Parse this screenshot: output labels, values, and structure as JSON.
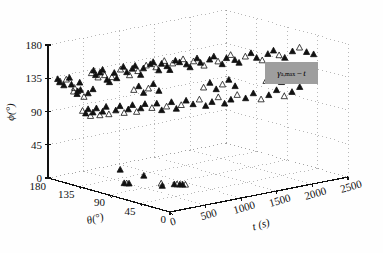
{
  "figure": {
    "kind": "3d-scatter-plot",
    "background": "#ffffff",
    "marker_fill_color": "#111111",
    "marker_edge_color": "#111111",
    "grid_color": "#9a9a9a",
    "axis_color": "#111111",
    "legend_box_color": "#9e9e9e"
  },
  "axes": {
    "phi": {
      "label": "ϕ(°)",
      "ticks": [
        "180",
        "135",
        "90",
        "45",
        "0"
      ],
      "values": [
        180,
        135,
        90,
        45,
        0
      ],
      "min": 0,
      "max": 180
    },
    "theta": {
      "label": "θ(°)",
      "ticks": [
        "180",
        "135",
        "90",
        "45",
        "0"
      ],
      "values": [
        180,
        135,
        90,
        45,
        0
      ],
      "min": 0,
      "max": 180
    },
    "t": {
      "label": "t (s)",
      "ticks": [
        "0",
        "500",
        "1000",
        "1500",
        "2000",
        "2500"
      ],
      "values": [
        0,
        500,
        1000,
        1500,
        2000,
        2500
      ],
      "min": 0,
      "max": 2500
    }
  },
  "legend": {
    "entries": [
      {
        "symbol_main": "γ",
        "symbol_sub": "a,max",
        "separator": "−",
        "symbol_tail": "t",
        "text": "γa,max−t"
      }
    ],
    "position": "center-right"
  },
  "chart_data": {
    "type": "scatter",
    "title": "",
    "xlabel": "t (s)",
    "ylabel": "θ(°)",
    "zlabel": "ϕ(°)",
    "xlim": [
      0,
      2500
    ],
    "ylim": [
      0,
      180
    ],
    "zlim": [
      0,
      180
    ],
    "grid": true,
    "legend_position": "center-right",
    "series": [
      {
        "name": "γa,max−t",
        "marker": "triangle",
        "points": [
          {
            "t": 60,
            "theta": 172,
            "phi": 135
          },
          {
            "t": 55,
            "theta": 168,
            "phi": 133
          },
          {
            "t": 70,
            "theta": 170,
            "phi": 131
          },
          {
            "t": 80,
            "theta": 165,
            "phi": 128
          },
          {
            "t": 95,
            "theta": 163,
            "phi": 136
          },
          {
            "t": 110,
            "theta": 160,
            "phi": 139
          },
          {
            "t": 120,
            "theta": 158,
            "phi": 130
          },
          {
            "t": 135,
            "theta": 155,
            "phi": 126
          },
          {
            "t": 150,
            "theta": 152,
            "phi": 122
          },
          {
            "t": 160,
            "theta": 150,
            "phi": 134
          },
          {
            "t": 230,
            "theta": 140,
            "phi": 148
          },
          {
            "t": 240,
            "theta": 138,
            "phi": 152
          },
          {
            "t": 250,
            "theta": 136,
            "phi": 146
          },
          {
            "t": 265,
            "theta": 134,
            "phi": 143
          },
          {
            "t": 275,
            "theta": 132,
            "phi": 150
          },
          {
            "t": 290,
            "theta": 130,
            "phi": 154
          },
          {
            "t": 300,
            "theta": 128,
            "phi": 147
          },
          {
            "t": 315,
            "theta": 126,
            "phi": 141
          },
          {
            "t": 330,
            "theta": 124,
            "phi": 138
          },
          {
            "t": 345,
            "theta": 122,
            "phi": 145
          },
          {
            "t": 360,
            "theta": 120,
            "phi": 151
          },
          {
            "t": 375,
            "theta": 118,
            "phi": 144
          },
          {
            "t": 400,
            "theta": 115,
            "phi": 156
          },
          {
            "t": 420,
            "theta": 113,
            "phi": 160
          },
          {
            "t": 440,
            "theta": 110,
            "phi": 153
          },
          {
            "t": 460,
            "theta": 108,
            "phi": 149
          },
          {
            "t": 480,
            "theta": 106,
            "phi": 158
          },
          {
            "t": 500,
            "theta": 104,
            "phi": 162
          },
          {
            "t": 520,
            "theta": 102,
            "phi": 155
          },
          {
            "t": 540,
            "theta": 100,
            "phi": 150
          },
          {
            "t": 560,
            "theta": 98,
            "phi": 159
          },
          {
            "t": 580,
            "theta": 96,
            "phi": 163
          },
          {
            "t": 610,
            "theta": 93,
            "phi": 165
          },
          {
            "t": 630,
            "theta": 91,
            "phi": 168
          },
          {
            "t": 650,
            "theta": 89,
            "phi": 161
          },
          {
            "t": 670,
            "theta": 87,
            "phi": 157
          },
          {
            "t": 690,
            "theta": 85,
            "phi": 166
          },
          {
            "t": 710,
            "theta": 83,
            "phi": 170
          },
          {
            "t": 730,
            "theta": 81,
            "phi": 163
          },
          {
            "t": 750,
            "theta": 79,
            "phi": 158
          },
          {
            "t": 770,
            "theta": 77,
            "phi": 167
          },
          {
            "t": 790,
            "theta": 75,
            "phi": 171
          },
          {
            "t": 820,
            "theta": 72,
            "phi": 169
          },
          {
            "t": 850,
            "theta": 70,
            "phi": 173
          },
          {
            "t": 880,
            "theta": 68,
            "phi": 166
          },
          {
            "t": 910,
            "theta": 66,
            "phi": 162
          },
          {
            "t": 940,
            "theta": 64,
            "phi": 170
          },
          {
            "t": 970,
            "theta": 62,
            "phi": 174
          },
          {
            "t": 1000,
            "theta": 60,
            "phi": 168
          },
          {
            "t": 1030,
            "theta": 58,
            "phi": 164
          },
          {
            "t": 1080,
            "theta": 55,
            "phi": 172
          },
          {
            "t": 1120,
            "theta": 53,
            "phi": 176
          },
          {
            "t": 1160,
            "theta": 51,
            "phi": 169
          },
          {
            "t": 1200,
            "theta": 49,
            "phi": 165
          },
          {
            "t": 1240,
            "theta": 47,
            "phi": 173
          },
          {
            "t": 1280,
            "theta": 45,
            "phi": 177
          },
          {
            "t": 1320,
            "theta": 43,
            "phi": 170
          },
          {
            "t": 1360,
            "theta": 41,
            "phi": 166
          },
          {
            "t": 1420,
            "theta": 38,
            "phi": 174
          },
          {
            "t": 1480,
            "theta": 36,
            "phi": 178
          },
          {
            "t": 1540,
            "theta": 34,
            "phi": 171
          },
          {
            "t": 1600,
            "theta": 32,
            "phi": 167
          },
          {
            "t": 1660,
            "theta": 30,
            "phi": 175
          },
          {
            "t": 1720,
            "theta": 28,
            "phi": 179
          },
          {
            "t": 1780,
            "theta": 26,
            "phi": 172
          },
          {
            "t": 1840,
            "theta": 24,
            "phi": 168
          },
          {
            "t": 1920,
            "theta": 21,
            "phi": 176
          },
          {
            "t": 2000,
            "theta": 19,
            "phi": 180
          },
          {
            "t": 2080,
            "theta": 17,
            "phi": 173
          },
          {
            "t": 2160,
            "theta": 15,
            "phi": 169
          },
          {
            "t": 200,
            "theta": 150,
            "phi": 95
          },
          {
            "t": 215,
            "theta": 147,
            "phi": 92
          },
          {
            "t": 230,
            "theta": 145,
            "phi": 98
          },
          {
            "t": 245,
            "theta": 143,
            "phi": 89
          },
          {
            "t": 260,
            "theta": 141,
            "phi": 94
          },
          {
            "t": 280,
            "theta": 138,
            "phi": 100
          },
          {
            "t": 300,
            "theta": 135,
            "phi": 91
          },
          {
            "t": 320,
            "theta": 133,
            "phi": 96
          },
          {
            "t": 340,
            "theta": 130,
            "phi": 103
          },
          {
            "t": 360,
            "theta": 128,
            "phi": 93
          },
          {
            "t": 400,
            "theta": 122,
            "phi": 99
          },
          {
            "t": 430,
            "theta": 119,
            "phi": 105
          },
          {
            "t": 460,
            "theta": 116,
            "phi": 96
          },
          {
            "t": 490,
            "theta": 113,
            "phi": 101
          },
          {
            "t": 520,
            "theta": 110,
            "phi": 107
          },
          {
            "t": 550,
            "theta": 107,
            "phi": 98
          },
          {
            "t": 580,
            "theta": 104,
            "phi": 103
          },
          {
            "t": 610,
            "theta": 101,
            "phi": 109
          },
          {
            "t": 660,
            "theta": 96,
            "phi": 104
          },
          {
            "t": 700,
            "theta": 93,
            "phi": 110
          },
          {
            "t": 740,
            "theta": 90,
            "phi": 101
          },
          {
            "t": 780,
            "theta": 87,
            "phi": 106
          },
          {
            "t": 820,
            "theta": 84,
            "phi": 112
          },
          {
            "t": 860,
            "theta": 81,
            "phi": 103
          },
          {
            "t": 900,
            "theta": 78,
            "phi": 108
          },
          {
            "t": 940,
            "theta": 75,
            "phi": 114
          },
          {
            "t": 1000,
            "theta": 71,
            "phi": 109
          },
          {
            "t": 1060,
            "theta": 68,
            "phi": 115
          },
          {
            "t": 1120,
            "theta": 65,
            "phi": 106
          },
          {
            "t": 1180,
            "theta": 62,
            "phi": 111
          },
          {
            "t": 1240,
            "theta": 59,
            "phi": 117
          },
          {
            "t": 1300,
            "theta": 56,
            "phi": 108
          },
          {
            "t": 1360,
            "theta": 53,
            "phi": 113
          },
          {
            "t": 1420,
            "theta": 50,
            "phi": 119
          },
          {
            "t": 1500,
            "theta": 46,
            "phi": 114
          },
          {
            "t": 1580,
            "theta": 43,
            "phi": 120
          },
          {
            "t": 1660,
            "theta": 40,
            "phi": 111
          },
          {
            "t": 1740,
            "theta": 37,
            "phi": 116
          },
          {
            "t": 1820,
            "theta": 34,
            "phi": 122
          },
          {
            "t": 1900,
            "theta": 31,
            "phi": 113
          },
          {
            "t": 1980,
            "theta": 28,
            "phi": 118
          },
          {
            "t": 2060,
            "theta": 25,
            "phi": 124
          },
          {
            "t": 150,
            "theta": 158,
            "phi": 120
          },
          {
            "t": 170,
            "theta": 155,
            "phi": 117
          },
          {
            "t": 190,
            "theta": 152,
            "phi": 123
          },
          {
            "t": 210,
            "theta": 149,
            "phi": 114
          },
          {
            "t": 240,
            "theta": 146,
            "phi": 119
          },
          {
            "t": 270,
            "theta": 142,
            "phi": 125
          },
          {
            "t": 520,
            "theta": 108,
            "phi": 128
          },
          {
            "t": 560,
            "theta": 105,
            "phi": 133
          },
          {
            "t": 600,
            "theta": 102,
            "phi": 124
          },
          {
            "t": 640,
            "theta": 99,
            "phi": 130
          },
          {
            "t": 680,
            "theta": 96,
            "phi": 136
          },
          {
            "t": 720,
            "theta": 92,
            "phi": 127
          },
          {
            "t": 1100,
            "theta": 66,
            "phi": 131
          },
          {
            "t": 1160,
            "theta": 63,
            "phi": 137
          },
          {
            "t": 1220,
            "theta": 60,
            "phi": 128
          },
          {
            "t": 1280,
            "theta": 57,
            "phi": 134
          },
          {
            "t": 1340,
            "theta": 54,
            "phi": 140
          },
          {
            "t": 1400,
            "theta": 51,
            "phi": 131
          },
          {
            "t": 1720,
            "theta": 39,
            "phi": 135
          },
          {
            "t": 1800,
            "theta": 36,
            "phi": 141
          },
          {
            "t": 1880,
            "theta": 33,
            "phi": 132
          },
          {
            "t": 1960,
            "theta": 30,
            "phi": 138
          },
          {
            "t": 300,
            "theta": 105,
            "phi": 25
          },
          {
            "t": 470,
            "theta": 88,
            "phi": 18
          },
          {
            "t": 600,
            "theta": 76,
            "phi": 8
          },
          {
            "t": 605,
            "theta": 75,
            "phi": 5
          },
          {
            "t": 480,
            "theta": 118,
            "phi": 0
          },
          {
            "t": 495,
            "theta": 116,
            "phi": 0
          },
          {
            "t": 510,
            "theta": 114,
            "phi": 0
          },
          {
            "t": 860,
            "theta": 84,
            "phi": 0
          },
          {
            "t": 880,
            "theta": 82,
            "phi": 0
          },
          {
            "t": 900,
            "theta": 80,
            "phi": 0
          },
          {
            "t": 920,
            "theta": 78,
            "phi": 0
          },
          {
            "t": 940,
            "theta": 76,
            "phi": 0
          }
        ]
      }
    ]
  }
}
